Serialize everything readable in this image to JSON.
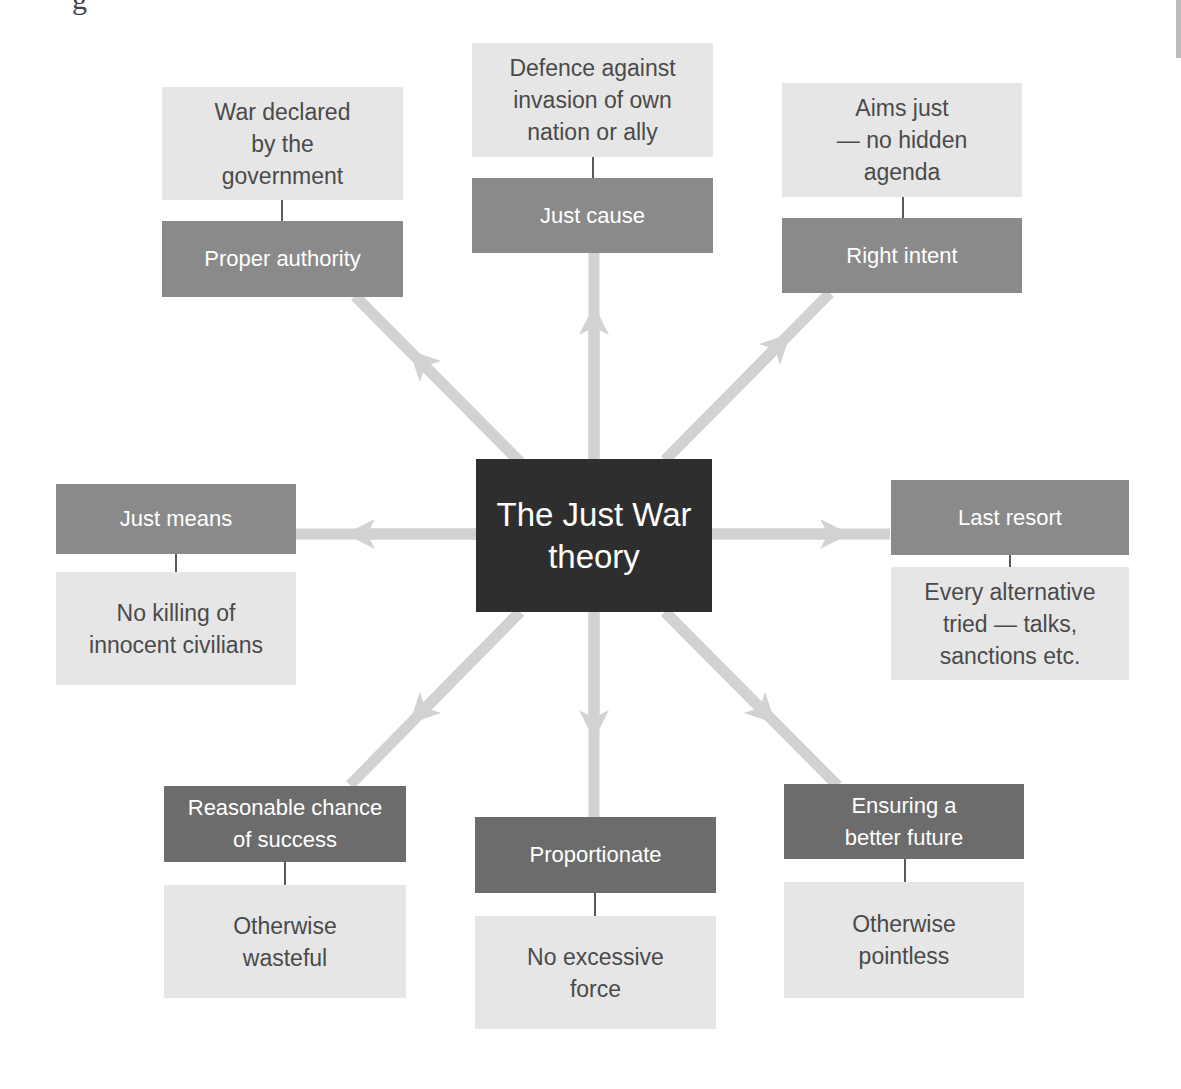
{
  "diagram": {
    "title": "The Just War theory",
    "center_label": "The Just War\ntheory",
    "colors": {
      "center_box": "#2e2e2e",
      "label_box": "#8a8a8a",
      "label_box_dark": "#6c6c6c",
      "description_box": "#e6e6e6",
      "arrow": "#d2d2d2",
      "connector": "#5a5a5a"
    },
    "nodes": [
      {
        "id": "proper-authority",
        "label": "Proper authority",
        "description": "War declared\nby the\ngovernment"
      },
      {
        "id": "just-cause",
        "label": "Just cause",
        "description": "Defence against\ninvasion of own\nnation or ally"
      },
      {
        "id": "right-intent",
        "label": "Right intent",
        "description": "Aims just\n— no hidden\nagenda"
      },
      {
        "id": "just-means",
        "label": "Just means",
        "description": "No killing of\ninnocent civilians"
      },
      {
        "id": "last-resort",
        "label": "Last resort",
        "description": "Every alternative\ntried — talks,\nsanctions etc."
      },
      {
        "id": "reasonable-chance",
        "label": "Reasonable chance\nof success",
        "description": "Otherwise\nwasteful"
      },
      {
        "id": "proportionate",
        "label": "Proportionate",
        "description": "No excessive\nforce"
      },
      {
        "id": "better-future",
        "label": "Ensuring a\nbetter future",
        "description": "Otherwise\npointless"
      }
    ],
    "edges": [
      {
        "from": "center",
        "to": "proper-authority"
      },
      {
        "from": "center",
        "to": "just-cause"
      },
      {
        "from": "center",
        "to": "right-intent"
      },
      {
        "from": "center",
        "to": "just-means"
      },
      {
        "from": "center",
        "to": "last-resort"
      },
      {
        "from": "center",
        "to": "reasonable-chance"
      },
      {
        "from": "center",
        "to": "proportionate"
      },
      {
        "from": "center",
        "to": "better-future"
      }
    ],
    "cropped_top_text": "g"
  }
}
